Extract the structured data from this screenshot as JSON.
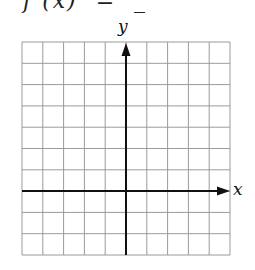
{
  "header": {
    "clipped_text": " f (x)  =  _"
  },
  "graph": {
    "x_label": "x",
    "y_label": "y",
    "grid": {
      "columns": 10,
      "rows": 10,
      "left": 22,
      "top": 42,
      "right": 230,
      "bottom": 255
    },
    "origin": {
      "column": 5,
      "row": 7
    },
    "grid_color": "#9a9a9a",
    "axis_color": "#111111"
  },
  "chart_data": {
    "type": "scatter",
    "title": "",
    "xlabel": "x",
    "ylabel": "y",
    "grid": true,
    "series": [],
    "x_cells": 10,
    "y_cells": 10,
    "x_axis_position": "3 cells above bottom",
    "y_axis_position": "5 cells from left"
  }
}
